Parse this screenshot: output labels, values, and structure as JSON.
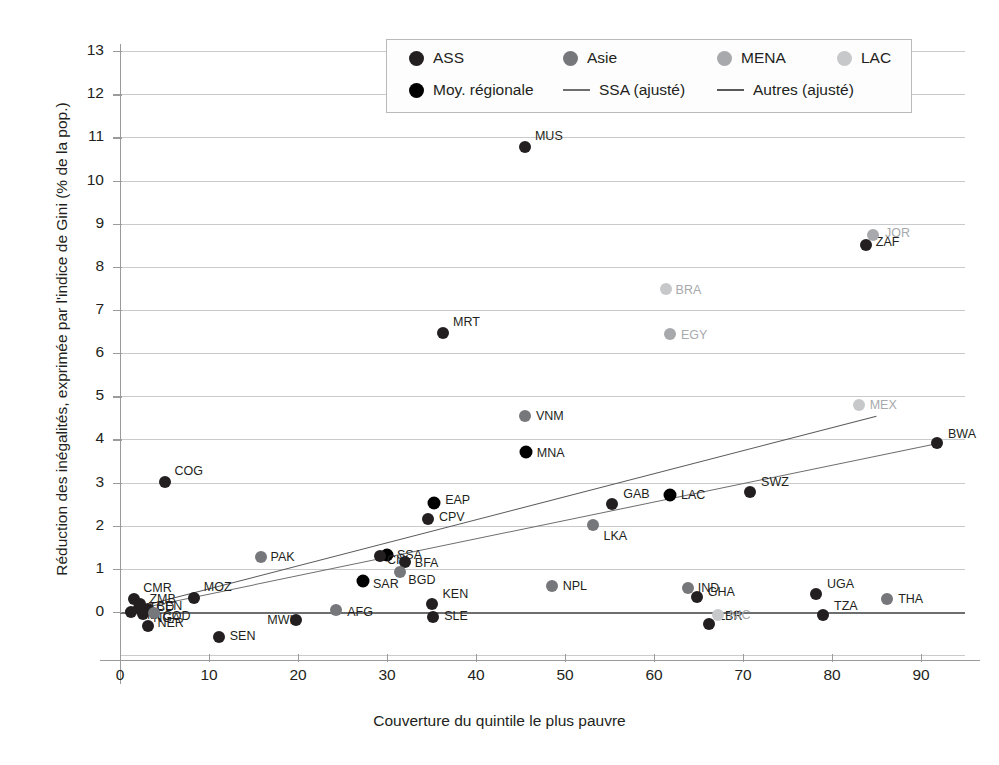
{
  "chart_data": {
    "type": "scatter",
    "title": "",
    "xlabel": "Couverture du quintile le plus pauvre",
    "ylabel": "Réduction des inégalités, exprimée par l'indice de Gini (% de la pop.)",
    "xlim": [
      -2.5,
      97
    ],
    "ylim": [
      -1.3,
      13.4
    ],
    "xticks": [
      0,
      10,
      20,
      30,
      40,
      50,
      60,
      70,
      80,
      90
    ],
    "yticks": [
      0,
      1,
      2,
      3,
      4,
      5,
      6,
      7,
      8,
      9,
      10,
      11,
      12,
      13
    ],
    "grid": true,
    "legend_position": "top-center",
    "colors": {
      "ASS": "#231f20",
      "Asie": "#76777a",
      "MENA": "#a7a9ac",
      "LAC": "#c7c8ca",
      "Moy. régionale": "#000000",
      "SSA_line": "#6d6e70",
      "Autres_line": "#58595b"
    },
    "legend": [
      {
        "label": "ASS",
        "type": "dot",
        "color": "#231f20"
      },
      {
        "label": "Asie",
        "type": "dot",
        "color": "#76777a"
      },
      {
        "label": "MENA",
        "type": "dot",
        "color": "#a7a9ac"
      },
      {
        "label": "LAC",
        "type": "dot",
        "color": "#c7c8ca"
      },
      {
        "label": "Moy. régionale",
        "type": "dot",
        "color": "#000000"
      },
      {
        "label": "SSA (ajusté)",
        "type": "line",
        "color": "#6d6e70"
      },
      {
        "label": "Autres (ajusté)",
        "type": "line",
        "color": "#58595b"
      }
    ],
    "fit_lines": [
      {
        "name": "SSA (ajusté)",
        "color": "#6d6e70",
        "x1": 0.6,
        "y1": 0.02,
        "x2": 92.0,
        "y2": 3.92
      },
      {
        "name": "Autres (ajusté)",
        "color": "#58595b",
        "x1": 0.6,
        "y1": 0.05,
        "x2": 85.0,
        "y2": 4.55
      }
    ],
    "points": [
      {
        "code": "MUS",
        "x": 45.5,
        "y": 10.78,
        "group": "ASS",
        "lx": 10,
        "ly": -11
      },
      {
        "code": "ZAF",
        "x": 83.8,
        "y": 8.5,
        "group": "ASS",
        "lx": 10,
        "ly": -3
      },
      {
        "code": "JOR",
        "x": 84.6,
        "y": 8.74,
        "group": "MENA",
        "lx": 12,
        "ly": -2
      },
      {
        "code": "BRA",
        "x": 61.3,
        "y": 7.48,
        "group": "LAC",
        "lx": 10,
        "ly": 1
      },
      {
        "code": "MRT",
        "x": 36.3,
        "y": 6.47,
        "group": "ASS",
        "lx": 10,
        "ly": -11
      },
      {
        "code": "EGY",
        "x": 61.8,
        "y": 6.45,
        "group": "MENA",
        "lx": 11,
        "ly": 1
      },
      {
        "code": "VNM",
        "x": 45.5,
        "y": 4.55,
        "group": "Asie",
        "lx": 11,
        "ly": 0
      },
      {
        "code": "MEX",
        "x": 83.0,
        "y": 4.8,
        "group": "LAC",
        "lx": 11,
        "ly": 0
      },
      {
        "code": "BWA",
        "x": 91.8,
        "y": 3.92,
        "group": "ASS",
        "lx": 11,
        "ly": -9
      },
      {
        "code": "MNA",
        "x": 45.6,
        "y": 3.7,
        "group": "Moy. régionale",
        "lx": 11,
        "ly": 1
      },
      {
        "code": "COG",
        "x": 5.0,
        "y": 3.02,
        "group": "ASS",
        "lx": 10,
        "ly": -11
      },
      {
        "code": "SWZ",
        "x": 70.8,
        "y": 2.79,
        "group": "ASS",
        "lx": 11,
        "ly": -10
      },
      {
        "code": "LAC",
        "x": 61.8,
        "y": 2.7,
        "group": "Moy. régionale",
        "lx": 11,
        "ly": 0
      },
      {
        "code": "GAB",
        "x": 55.3,
        "y": 2.5,
        "group": "ASS",
        "lx": 11,
        "ly": -10
      },
      {
        "code": "EAP",
        "x": 35.3,
        "y": 2.52,
        "group": "Moy. régionale",
        "lx": 11,
        "ly": -3
      },
      {
        "code": "CPV",
        "x": 34.6,
        "y": 2.15,
        "group": "ASS",
        "lx": 11,
        "ly": -2
      },
      {
        "code": "LKA",
        "x": 53.2,
        "y": 2.02,
        "group": "Asie",
        "lx": 10,
        "ly": 11
      },
      {
        "code": "PAK",
        "x": 15.8,
        "y": 1.27,
        "group": "Asie",
        "lx": 10,
        "ly": 0
      },
      {
        "code": "SSA",
        "x": 30.0,
        "y": 1.32,
        "group": "Moy. régionale",
        "lx": 10,
        "ly": 0
      },
      {
        "code": "CIV",
        "x": 29.2,
        "y": 1.3,
        "group": "ASS",
        "lx": 7,
        "ly": 4
      },
      {
        "code": "BFA",
        "x": 32.0,
        "y": 1.17,
        "group": "ASS",
        "lx": 10,
        "ly": 1
      },
      {
        "code": "BGD",
        "x": 31.5,
        "y": 0.93,
        "group": "Asie",
        "lx": 8,
        "ly": 8
      },
      {
        "code": "SAR",
        "x": 27.3,
        "y": 0.72,
        "group": "Moy. régionale",
        "lx": 10,
        "ly": 3
      },
      {
        "code": "MOZ",
        "x": 8.3,
        "y": 0.32,
        "group": "ASS",
        "lx": 10,
        "ly": -11
      },
      {
        "code": "NPL",
        "x": 48.5,
        "y": 0.6,
        "group": "Asie",
        "lx": 11,
        "ly": 0
      },
      {
        "code": "IND",
        "x": 63.8,
        "y": 0.55,
        "group": "Asie",
        "lx": 10,
        "ly": 0
      },
      {
        "code": "GHA",
        "x": 64.8,
        "y": 0.34,
        "group": "ASS",
        "lx": 11,
        "ly": -5
      },
      {
        "code": "UGA",
        "x": 78.2,
        "y": 0.42,
        "group": "ASS",
        "lx": 11,
        "ly": -10
      },
      {
        "code": "THA",
        "x": 86.2,
        "y": 0.3,
        "group": "Asie",
        "lx": 11,
        "ly": 0
      },
      {
        "code": "CMR",
        "x": 1.6,
        "y": 0.3,
        "group": "ASS",
        "lx": 9,
        "ly": -11
      },
      {
        "code": "ZMB",
        "x": 2.3,
        "y": 0.19,
        "group": "ASS",
        "lx": 9,
        "ly": -5
      },
      {
        "code": "TCD",
        "x": 2.1,
        "y": 0.1,
        "group": "ASS",
        "lx": 10,
        "ly": -1
      },
      {
        "code": "BEN",
        "x": 3.1,
        "y": 0.07,
        "group": "ASS",
        "lx": 9,
        "ly": -3
      },
      {
        "code": "MLI",
        "x": 1.2,
        "y": 0.0,
        "group": "ASS",
        "lx": 9,
        "ly": 3
      },
      {
        "code": "NGA",
        "x": 2.6,
        "y": -0.05,
        "group": "ASS",
        "lx": 10,
        "ly": 4
      },
      {
        "code": "COD",
        "x": 3.8,
        "y": -0.02,
        "group": "Asie",
        "lx": 9,
        "ly": 3
      },
      {
        "code": "NER",
        "x": 3.2,
        "y": -0.33,
        "group": "ASS",
        "lx": 9,
        "ly": -3
      },
      {
        "code": "KEN",
        "x": 35.0,
        "y": 0.18,
        "group": "ASS",
        "lx": 11,
        "ly": -10
      },
      {
        "code": "SLE",
        "x": 35.2,
        "y": -0.12,
        "group": "ASS",
        "lx": 11,
        "ly": -1
      },
      {
        "code": "MWI",
        "x": 19.8,
        "y": -0.18,
        "group": "ASS",
        "lx": -29,
        "ly": 0
      },
      {
        "code": "AFG",
        "x": 24.3,
        "y": 0.05,
        "group": "Asie",
        "lx": 11,
        "ly": 2
      },
      {
        "code": "SEN",
        "x": 11.1,
        "y": -0.58,
        "group": "ASS",
        "lx": 11,
        "ly": -1
      },
      {
        "code": "LBR",
        "x": 66.2,
        "y": -0.27,
        "group": "ASS",
        "lx": 9,
        "ly": -8
      },
      {
        "code": "NIC",
        "x": 67.2,
        "y": -0.08,
        "group": "LAC",
        "lx": 11,
        "ly": 0
      },
      {
        "code": "TZA",
        "x": 79.0,
        "y": -0.08,
        "group": "ASS",
        "lx": 11,
        "ly": -9
      }
    ]
  }
}
